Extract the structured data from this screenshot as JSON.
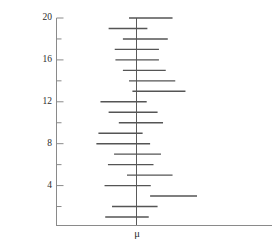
{
  "chart_data": {
    "type": "line",
    "title": "",
    "subtitle": "",
    "xlabel": "μ",
    "ylabel": "Interval number",
    "grid": false,
    "legend": null,
    "orientation": "horizontal",
    "mu_reference_value": 0,
    "y_axis": {
      "label": "Interval number",
      "range": [
        0.5,
        20.5
      ],
      "major_ticks": [
        4,
        8,
        12,
        16,
        20
      ],
      "minor_ticks": [
        2,
        6,
        10,
        14,
        18
      ],
      "tick_labels": [
        "4",
        "8",
        "12",
        "16",
        "20"
      ]
    },
    "x_axis": {
      "label": "μ",
      "tick_labels": [
        "μ"
      ],
      "tick_values": [
        0
      ],
      "range": [
        -1.0,
        1.9
      ],
      "ticks_visible": false
    },
    "intervals": [
      {
        "interval_number": 20,
        "lower": -0.11,
        "upper": 0.53,
        "covers_mu": true
      },
      {
        "interval_number": 19,
        "lower": -0.41,
        "upper": 0.16,
        "covers_mu": true
      },
      {
        "interval_number": 18,
        "lower": -0.2,
        "upper": 0.46,
        "covers_mu": true
      },
      {
        "interval_number": 17,
        "lower": -0.32,
        "upper": 0.33,
        "covers_mu": true
      },
      {
        "interval_number": 16,
        "lower": -0.31,
        "upper": 0.33,
        "covers_mu": true
      },
      {
        "interval_number": 15,
        "lower": -0.2,
        "upper": 0.43,
        "covers_mu": true
      },
      {
        "interval_number": 14,
        "lower": -0.11,
        "upper": 0.57,
        "covers_mu": true
      },
      {
        "interval_number": 13,
        "lower": -0.06,
        "upper": 0.72,
        "covers_mu": true
      },
      {
        "interval_number": 12,
        "lower": -0.53,
        "upper": 0.15,
        "covers_mu": true
      },
      {
        "interval_number": 11,
        "lower": -0.41,
        "upper": 0.31,
        "covers_mu": true
      },
      {
        "interval_number": 10,
        "lower": -0.26,
        "upper": 0.39,
        "covers_mu": true
      },
      {
        "interval_number": 9,
        "lower": -0.56,
        "upper": 0.09,
        "covers_mu": true
      },
      {
        "interval_number": 8,
        "lower": -0.59,
        "upper": 0.2,
        "covers_mu": true
      },
      {
        "interval_number": 7,
        "lower": -0.33,
        "upper": 0.36,
        "covers_mu": true
      },
      {
        "interval_number": 6,
        "lower": -0.42,
        "upper": 0.25,
        "covers_mu": true
      },
      {
        "interval_number": 5,
        "lower": -0.14,
        "upper": 0.53,
        "covers_mu": true
      },
      {
        "interval_number": 4,
        "lower": -0.47,
        "upper": 0.21,
        "covers_mu": true
      },
      {
        "interval_number": 3,
        "lower": 0.2,
        "upper": 0.89,
        "covers_mu": false
      },
      {
        "interval_number": 2,
        "lower": -0.36,
        "upper": 0.31,
        "covers_mu": true
      },
      {
        "interval_number": 1,
        "lower": -0.46,
        "upper": 0.18,
        "covers_mu": true
      }
    ],
    "coverage_count": 19,
    "total_intervals": 20,
    "colors": {
      "interval_line": "#555555",
      "axis": "#888888",
      "reference_line": "#555555",
      "text": "#2b2b2b",
      "background": "#ffffff"
    }
  },
  "ticks": [
    {
      "value": 20,
      "label": "20"
    },
    {
      "value": 16,
      "label": "16"
    },
    {
      "value": 12,
      "label": "12"
    },
    {
      "value": 8,
      "label": "8"
    },
    {
      "value": 4,
      "label": "4"
    }
  ],
  "axis": {
    "y_title": "Interval number",
    "x_title": "μ"
  }
}
